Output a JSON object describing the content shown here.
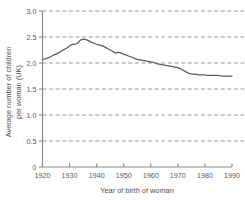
{
  "chart_data": {
    "type": "line",
    "title": "",
    "subtitle": "",
    "xlabel": "Year of birth of woman",
    "ylabel": "Average number of children per woman (UK)",
    "ylabel_line1": "Average number of children",
    "ylabel_line2": "per woman (UK)",
    "xlim": [
      1920,
      1990
    ],
    "ylim": [
      0,
      3.0
    ],
    "xticks": [
      1920,
      1930,
      1940,
      1950,
      1960,
      1970,
      1980,
      1990
    ],
    "xtick_labels": [
      "1920",
      "1930",
      "1940",
      "1950",
      "1960",
      "1970",
      "1980",
      "1990"
    ],
    "yticks": [
      0,
      0.5,
      1.0,
      1.5,
      2.0,
      2.5,
      3.0
    ],
    "ytick_labels": [
      "0",
      "0.5",
      "1.0",
      "1.5",
      "2.0",
      "2.5",
      "3.0"
    ],
    "grid": "horizontal-dashed",
    "legend": "none",
    "line_color": "#5b5b5b",
    "grid_color": "#8c8c8c",
    "axis_color": "#8a8a8a",
    "background_color": "#ffffff",
    "series": [
      {
        "name": "Average number of children per woman (UK)",
        "x": [
          1920,
          1921,
          1922,
          1923,
          1924,
          1925,
          1926,
          1927,
          1928,
          1929,
          1930,
          1931,
          1932,
          1933,
          1934,
          1935,
          1936,
          1937,
          1938,
          1939,
          1940,
          1941,
          1942,
          1943,
          1944,
          1945,
          1946,
          1947,
          1948,
          1949,
          1950,
          1951,
          1952,
          1953,
          1954,
          1955,
          1956,
          1957,
          1958,
          1959,
          1960,
          1961,
          1962,
          1963,
          1964,
          1965,
          1966,
          1967,
          1968,
          1969,
          1970,
          1971,
          1972,
          1973,
          1974,
          1975,
          1976,
          1977,
          1978,
          1979,
          1980,
          1981,
          1982,
          1983,
          1984,
          1985,
          1986,
          1987,
          1988,
          1989,
          1990
        ],
        "values": [
          2.07,
          2.08,
          2.1,
          2.12,
          2.15,
          2.17,
          2.2,
          2.23,
          2.26,
          2.29,
          2.33,
          2.36,
          2.36,
          2.38,
          2.44,
          2.46,
          2.45,
          2.43,
          2.4,
          2.38,
          2.36,
          2.35,
          2.33,
          2.31,
          2.28,
          2.25,
          2.22,
          2.19,
          2.21,
          2.19,
          2.17,
          2.15,
          2.13,
          2.11,
          2.09,
          2.07,
          2.06,
          2.05,
          2.04,
          2.03,
          2.02,
          2.01,
          1.99,
          1.98,
          1.97,
          1.96,
          1.95,
          1.94,
          1.93,
          1.92,
          1.91,
          1.89,
          1.86,
          1.83,
          1.8,
          1.79,
          1.78,
          1.78,
          1.77,
          1.77,
          1.77,
          1.76,
          1.76,
          1.76,
          1.76,
          1.76,
          1.75,
          1.75,
          1.75,
          1.75,
          1.75
        ]
      }
    ]
  }
}
